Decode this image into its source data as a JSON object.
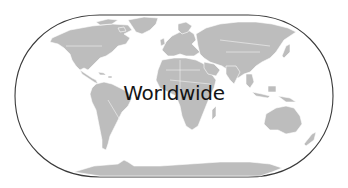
{
  "map": {
    "label": "Worldwide",
    "projection": "robinson-like rounded outline",
    "colors": {
      "land": "#bdbdbd",
      "ocean": "#ffffff",
      "frame": "#3a3a3a",
      "label": "#141414",
      "borders": "#ffffff"
    },
    "regions": [
      "north-america",
      "greenland",
      "south-america",
      "europe",
      "africa",
      "asia",
      "australia",
      "oceania-islands",
      "antarctica"
    ]
  }
}
